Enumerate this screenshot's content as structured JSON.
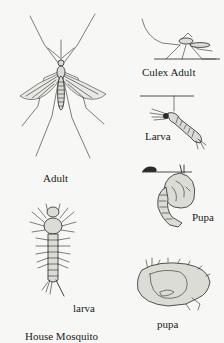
{
  "diagram": {
    "title": "House Mosquito",
    "figures": [
      {
        "id": "adult-topview",
        "label": "Adult"
      },
      {
        "id": "culex-adult-resting",
        "label": "Culex Adult"
      },
      {
        "id": "larva-hanging",
        "label": "Larva"
      },
      {
        "id": "pupa-surface",
        "label": "Pupa"
      },
      {
        "id": "larva-topview",
        "label": "larva"
      },
      {
        "id": "pupa-side",
        "label": "pupa"
      }
    ]
  }
}
